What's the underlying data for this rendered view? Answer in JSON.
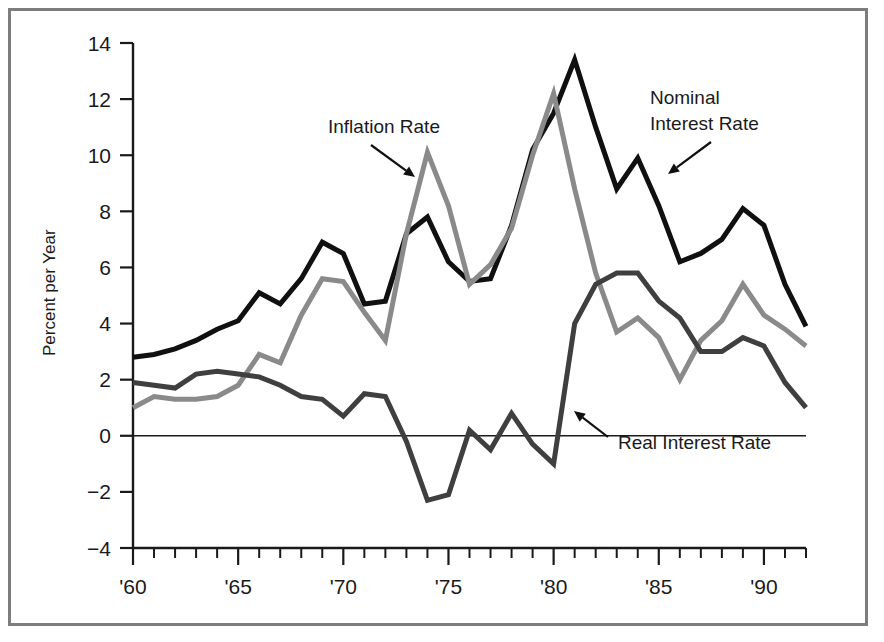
{
  "chart_data": {
    "type": "line",
    "title": "",
    "xlabel": "",
    "ylabel": "Percent per Year",
    "xlim": [
      1960,
      1992
    ],
    "ylim": [
      -4,
      14
    ],
    "ytick_values": [
      14,
      12,
      10,
      8,
      6,
      4,
      2,
      0,
      -2,
      -4
    ],
    "ytick_labels": [
      "14",
      "12",
      "10",
      "8",
      "6",
      "4",
      "2",
      "0",
      "−2",
      "−4"
    ],
    "xtick_values": [
      1960,
      1965,
      1970,
      1975,
      1980,
      1985,
      1990
    ],
    "xtick_labels": [
      "'60",
      "'65",
      "'70",
      "'75",
      "'80",
      "'85",
      "'90"
    ],
    "xtick_minor_step": 1,
    "grid": false,
    "zero_line": true,
    "legend": "annotations",
    "x": [
      1960,
      1961,
      1962,
      1963,
      1964,
      1965,
      1966,
      1967,
      1968,
      1969,
      1970,
      1971,
      1972,
      1973,
      1974,
      1975,
      1976,
      1977,
      1978,
      1979,
      1980,
      1981,
      1982,
      1983,
      1984,
      1985,
      1986,
      1987,
      1988,
      1989,
      1990,
      1991,
      1992
    ],
    "series": [
      {
        "name": "Nominal Interest Rate",
        "color": "#101010",
        "width": 5.0,
        "values": [
          2.8,
          2.9,
          3.1,
          3.4,
          3.8,
          4.1,
          5.1,
          4.7,
          5.6,
          6.9,
          6.5,
          4.7,
          4.8,
          7.2,
          7.8,
          6.2,
          5.5,
          5.6,
          7.5,
          10.2,
          11.5,
          13.4,
          11.0,
          8.8,
          9.9,
          8.2,
          6.2,
          6.5,
          7.0,
          8.1,
          7.5,
          5.4,
          3.9
        ]
      },
      {
        "name": "Inflation Rate",
        "color": "#8a8a8a",
        "width": 5.0,
        "values": [
          1.0,
          1.4,
          1.3,
          1.3,
          1.4,
          1.8,
          2.9,
          2.6,
          4.3,
          5.6,
          5.5,
          4.4,
          3.4,
          7.2,
          10.1,
          8.2,
          5.4,
          6.1,
          7.4,
          10.0,
          12.2,
          8.8,
          5.8,
          3.7,
          4.2,
          3.5,
          2.0,
          3.4,
          4.1,
          5.4,
          4.3,
          3.8,
          3.2
        ]
      },
      {
        "name": "Real Interest Rate",
        "color": "#3f3f3f",
        "width": 5.0,
        "values": [
          1.9,
          1.8,
          1.7,
          2.2,
          2.3,
          2.2,
          2.1,
          1.8,
          1.4,
          1.3,
          0.7,
          1.5,
          1.4,
          -0.2,
          -2.3,
          -2.1,
          0.2,
          -0.5,
          0.8,
          -0.3,
          -1.0,
          4.0,
          5.4,
          5.8,
          5.8,
          4.8,
          4.2,
          3.0,
          3.0,
          3.5,
          3.2,
          1.9,
          1.0
        ]
      }
    ],
    "annotations": [
      {
        "name": "inflation-rate-annotation",
        "text": "Inflation Rate",
        "label_x": 317,
        "label_y": 122,
        "arrow_from_x": 360,
        "arrow_from_y": 134,
        "arrow_to_x": 404,
        "arrow_to_y": 166
      },
      {
        "name": "nominal-interest-rate-annotation",
        "text_line1": "Nominal",
        "text_line2": "Interest Rate",
        "label_x": 639,
        "label_y": 93,
        "label_y2": 119,
        "arrow_from_x": 700,
        "arrow_from_y": 131,
        "arrow_to_x": 657,
        "arrow_to_y": 163
      },
      {
        "name": "real-interest-rate-annotation",
        "text": "Real Interest Rate",
        "label_x": 607,
        "label_y": 438,
        "arrow_from_x": 597,
        "arrow_from_y": 426,
        "arrow_to_x": 563,
        "arrow_to_y": 400
      }
    ]
  },
  "figure": {
    "ylabel": "Percent per Year"
  }
}
